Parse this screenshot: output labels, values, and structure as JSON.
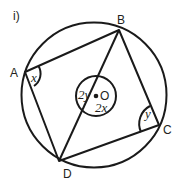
{
  "question_label": "i)",
  "points": {
    "A": {
      "label": "A",
      "x": 25,
      "y": 72
    },
    "B": {
      "label": "B",
      "x": 119,
      "y": 30
    },
    "C": {
      "label": "C",
      "x": 159,
      "y": 125
    },
    "D": {
      "label": "D",
      "x": 59,
      "y": 161
    },
    "O": {
      "label": "O",
      "x": 96,
      "y": 96
    }
  },
  "angles": {
    "A": "x",
    "C": "y",
    "O_reflex": "2y",
    "O_obtuse": "2x"
  },
  "colors": {
    "stroke": "#1a1a1a",
    "text": "#231f20"
  }
}
